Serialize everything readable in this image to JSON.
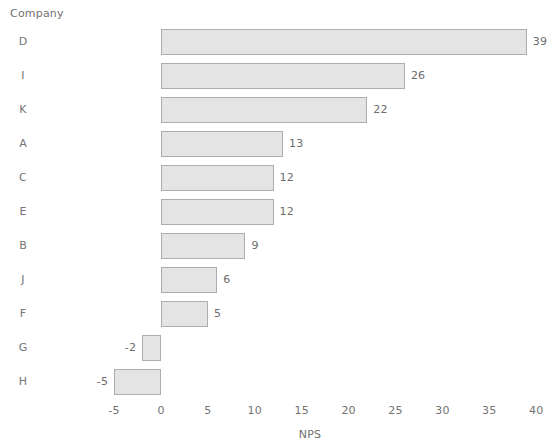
{
  "chart_data": {
    "type": "bar",
    "orientation": "horizontal",
    "title": "",
    "subtitle": "",
    "xlabel": "NPS",
    "ylabel": "Company",
    "categories": [
      "D",
      "I",
      "K",
      "A",
      "C",
      "E",
      "B",
      "J",
      "F",
      "G",
      "H"
    ],
    "values": [
      39,
      26,
      22,
      13,
      12,
      12,
      9,
      6,
      5,
      -2,
      -5
    ],
    "data_labels": [
      "39",
      "26",
      "22",
      "13",
      "12",
      "12",
      "9",
      "6",
      "5",
      "-2",
      "-5"
    ],
    "xlim": [
      -7,
      41
    ],
    "xticks": [
      -5,
      0,
      5,
      10,
      15,
      20,
      25,
      30,
      35,
      40
    ],
    "xticklabels": [
      "-5",
      "0",
      "5",
      "10",
      "15",
      "20",
      "25",
      "30",
      "35",
      "40"
    ],
    "grid": false,
    "legend": false,
    "series": [
      {
        "name": "NPS",
        "values": [
          39,
          26,
          22,
          13,
          12,
          12,
          9,
          6,
          5,
          -2,
          -5
        ]
      }
    ],
    "colors": {
      "bar_fill": "#e4e4e4",
      "bar_border": "#adadad",
      "text": "#6f6f6f",
      "background": "#ffffff"
    }
  }
}
